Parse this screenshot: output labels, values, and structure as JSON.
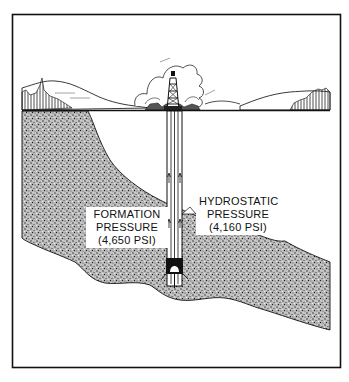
{
  "diagram": {
    "type": "well-pressure-cross-section",
    "labels": {
      "formation": {
        "line1": "FORMATION",
        "line2": "PRESSURE",
        "line3": "(4,650 PSI)"
      },
      "hydrostatic": {
        "line1": "HYDROSTATIC",
        "line2": "PRESSURE",
        "line3": "(4,160 PSI)"
      }
    },
    "values": {
      "formation_pressure_psi": 4650,
      "hydrostatic_pressure_psi": 4160
    },
    "elements": [
      "drilling-rig",
      "clouds",
      "hills",
      "ground-surface",
      "wellbore",
      "drill-bit",
      "stippled-formation-layer"
    ],
    "colors": {
      "ink": "#111111",
      "background": "#ffffff"
    }
  }
}
